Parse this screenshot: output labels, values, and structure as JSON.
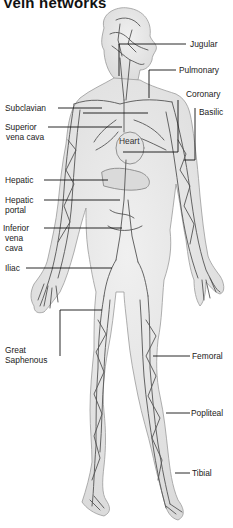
{
  "title": "Vein networks",
  "labels": {
    "jugular": "Jugular",
    "pulmonary": "Pulmonary",
    "coronary": "Coronary",
    "basilic": "Basilic",
    "subclavian": "Subclavian",
    "superior_vena_cava_1": "Superior",
    "superior_vena_cava_2": "vena cava",
    "heart": "Heart",
    "hepatic": "Hepatic",
    "hepatic_portal_1": "Hepatic",
    "hepatic_portal_2": "portal",
    "inferior_vena_cava_1": "Inferior",
    "inferior_vena_cava_2": "vena",
    "inferior_vena_cava_3": "cava",
    "iliac": "Iliac",
    "great_saphenous_1": "Great",
    "great_saphenous_2": "Saphenous",
    "femoral": "Femoral",
    "popliteal": "Popliteal",
    "tibial": "Tibial"
  },
  "colors": {
    "skin": "#e6e6e6",
    "skin_edge": "#9a9a9a",
    "vein": "#555555",
    "leader": "#111111",
    "text": "#222222"
  }
}
